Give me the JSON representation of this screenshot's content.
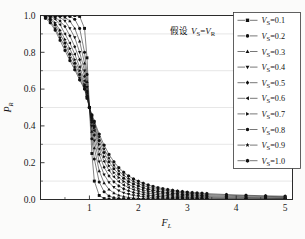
{
  "figure": {
    "background": "#fbfbfa",
    "plot_background": "#ffffff",
    "frame_color": "#2b2b2b",
    "grid_color": "#cfcfcf"
  },
  "annotation": {
    "cjk": "假设",
    "math_v_s": "V",
    "math_sub_s": "S",
    "equals": "=",
    "math_v_r": "V",
    "math_sub_r": "R",
    "full_text": "假设 VS = VR"
  },
  "axes": {
    "x_title_main": "F",
    "x_title_sub": "L",
    "y_title_main": "P",
    "y_title_sub": "R",
    "x_ticks": [
      "1",
      "2",
      "3",
      "4",
      "5"
    ],
    "x_tick_values": [
      1,
      2,
      3,
      4,
      5
    ],
    "y_ticks": [
      "0.0",
      "0.2",
      "0.4",
      "0.6",
      "0.8",
      "1.0"
    ],
    "y_tick_values": [
      0.0,
      0.2,
      0.4,
      0.6,
      0.8,
      1.0
    ],
    "xlim": [
      0,
      5.15
    ],
    "ylim": [
      0,
      1.0
    ],
    "x_minor_ticks": [
      0.5,
      1.5,
      2.5,
      3.5,
      4.5
    ],
    "y_minor_ticks": [
      0.1,
      0.3,
      0.5,
      0.7,
      0.9
    ],
    "grid": "horizontal-faint"
  },
  "legend": {
    "border_color": "#3a3a3a",
    "background": "#ffffff",
    "entries": [
      {
        "label_main": "V",
        "label_sub": "S",
        "label_val": "=0.1",
        "marker": "square",
        "text": "VS=0.1"
      },
      {
        "label_main": "V",
        "label_sub": "S",
        "label_val": "=0.2",
        "marker": "circle",
        "text": "VS=0.2"
      },
      {
        "label_main": "V",
        "label_sub": "S",
        "label_val": "=0.3",
        "marker": "triangle-up",
        "text": "VS=0.3"
      },
      {
        "label_main": "V",
        "label_sub": "S",
        "label_val": "=0.4",
        "marker": "triangle-down",
        "text": "VS=0.4"
      },
      {
        "label_main": "V",
        "label_sub": "S",
        "label_val": "=0.5",
        "marker": "diamond",
        "text": "VS=0.5"
      },
      {
        "label_main": "V",
        "label_sub": "S",
        "label_val": "=0.6",
        "marker": "triangle-left",
        "text": "VS=0.6"
      },
      {
        "label_main": "V",
        "label_sub": "S",
        "label_val": "=0.7",
        "marker": "triangle-right",
        "text": "VS=0.7"
      },
      {
        "label_main": "V",
        "label_sub": "S",
        "label_val": "=0.8",
        "marker": "circle",
        "text": "VS=0.8"
      },
      {
        "label_main": "V",
        "label_sub": "S",
        "label_val": "=0.9",
        "marker": "star",
        "text": "VS=0.9"
      },
      {
        "label_main": "V",
        "label_sub": "S",
        "label_val": "=1.0",
        "marker": "hexagon",
        "text": "VS=1.0"
      }
    ]
  },
  "chart_data": {
    "type": "line",
    "title": "",
    "xlabel": "F_L",
    "ylabel": "P_R",
    "xlim": [
      0,
      5.15
    ],
    "ylim": [
      0,
      1.0
    ],
    "grid": true,
    "legend_position": "upper-right",
    "annotation": "假设 VS = VR",
    "x_tick_labels": [
      "1",
      "2",
      "3",
      "4",
      "5"
    ],
    "y_tick_labels": [
      "0.0",
      "0.2",
      "0.4",
      "0.6",
      "0.8",
      "1.0"
    ],
    "note": "Family of sigmoid-like decreasing curves; all pass through approximately (1.0, 0.5). Smaller VS gives sharper transition. Markers placed at sampled x points.",
    "x": [
      0.1,
      0.2,
      0.3,
      0.4,
      0.5,
      0.6,
      0.7,
      0.8,
      0.9,
      0.95,
      1.0,
      1.05,
      1.1,
      1.2,
      1.3,
      1.4,
      1.5,
      1.6,
      1.7,
      1.8,
      1.9,
      2.0,
      2.1,
      2.2,
      2.3,
      2.4,
      2.5,
      2.6,
      2.7,
      2.8,
      2.9,
      3.0,
      3.1,
      3.2,
      3.3,
      3.4,
      3.8,
      4.2,
      4.6,
      5.0
    ],
    "series": [
      {
        "name": "VS=0.1",
        "marker": "square",
        "values": [
          1.0,
          1.0,
          1.0,
          1.0,
          1.0,
          1.0,
          1.0,
          0.995,
          0.93,
          0.77,
          0.5,
          0.25,
          0.1,
          0.022,
          0.005,
          0.001,
          0.0,
          0.0,
          0.0,
          0.0,
          0.0,
          0.0,
          0.0,
          0.0,
          0.0,
          0.0,
          0.0,
          0.0,
          0.0,
          0.0,
          0.0,
          0.0,
          0.0,
          0.0,
          0.0,
          0.0,
          0.0,
          0.0,
          0.0,
          0.0
        ]
      },
      {
        "name": "VS=0.2",
        "marker": "circle",
        "values": [
          1.0,
          1.0,
          1.0,
          1.0,
          0.999,
          0.995,
          0.98,
          0.93,
          0.8,
          0.68,
          0.5,
          0.33,
          0.22,
          0.095,
          0.042,
          0.019,
          0.009,
          0.005,
          0.003,
          0.002,
          0.001,
          0.001,
          0.0,
          0.0,
          0.0,
          0.0,
          0.0,
          0.0,
          0.0,
          0.0,
          0.0,
          0.0,
          0.0,
          0.0,
          0.0,
          0.0,
          0.0,
          0.0,
          0.0,
          0.0
        ]
      },
      {
        "name": "VS=0.3",
        "marker": "triangle-up",
        "values": [
          1.0,
          1.0,
          1.0,
          0.998,
          0.99,
          0.97,
          0.93,
          0.86,
          0.74,
          0.64,
          0.5,
          0.37,
          0.28,
          0.155,
          0.09,
          0.055,
          0.035,
          0.023,
          0.016,
          0.011,
          0.008,
          0.006,
          0.004,
          0.003,
          0.003,
          0.002,
          0.002,
          0.001,
          0.001,
          0.001,
          0.001,
          0.001,
          0.001,
          0.0,
          0.0,
          0.0,
          0.0,
          0.0,
          0.0,
          0.0
        ]
      },
      {
        "name": "VS=0.4",
        "marker": "triangle-down",
        "values": [
          1.0,
          1.0,
          0.998,
          0.99,
          0.97,
          0.93,
          0.88,
          0.8,
          0.7,
          0.61,
          0.5,
          0.4,
          0.32,
          0.205,
          0.135,
          0.093,
          0.066,
          0.048,
          0.036,
          0.028,
          0.022,
          0.018,
          0.014,
          0.012,
          0.01,
          0.008,
          0.007,
          0.006,
          0.005,
          0.005,
          0.004,
          0.004,
          0.003,
          0.003,
          0.003,
          0.002,
          0.002,
          0.001,
          0.001,
          0.001
        ]
      },
      {
        "name": "VS=0.5",
        "marker": "diamond",
        "values": [
          1.0,
          0.999,
          0.99,
          0.97,
          0.94,
          0.89,
          0.83,
          0.76,
          0.67,
          0.59,
          0.5,
          0.42,
          0.35,
          0.245,
          0.175,
          0.128,
          0.096,
          0.074,
          0.058,
          0.047,
          0.038,
          0.032,
          0.027,
          0.023,
          0.02,
          0.017,
          0.015,
          0.013,
          0.012,
          0.011,
          0.01,
          0.009,
          0.008,
          0.007,
          0.007,
          0.006,
          0.005,
          0.004,
          0.003,
          0.003
        ]
      },
      {
        "name": "VS=0.6",
        "marker": "triangle-left",
        "values": [
          1.0,
          0.995,
          0.98,
          0.95,
          0.9,
          0.85,
          0.79,
          0.72,
          0.645,
          0.58,
          0.5,
          0.43,
          0.375,
          0.275,
          0.207,
          0.158,
          0.123,
          0.098,
          0.079,
          0.065,
          0.054,
          0.046,
          0.039,
          0.034,
          0.03,
          0.026,
          0.023,
          0.021,
          0.019,
          0.017,
          0.016,
          0.014,
          0.013,
          0.012,
          0.011,
          0.011,
          0.009,
          0.007,
          0.006,
          0.005
        ]
      },
      {
        "name": "VS=0.7",
        "marker": "triangle-right",
        "values": [
          0.999,
          0.99,
          0.96,
          0.92,
          0.87,
          0.82,
          0.76,
          0.7,
          0.625,
          0.565,
          0.5,
          0.44,
          0.39,
          0.3,
          0.233,
          0.183,
          0.146,
          0.119,
          0.098,
          0.082,
          0.069,
          0.059,
          0.051,
          0.045,
          0.04,
          0.035,
          0.032,
          0.029,
          0.026,
          0.024,
          0.022,
          0.02,
          0.019,
          0.018,
          0.017,
          0.016,
          0.013,
          0.011,
          0.009,
          0.008
        ]
      },
      {
        "name": "VS=0.8",
        "marker": "circle",
        "values": [
          0.995,
          0.98,
          0.95,
          0.9,
          0.85,
          0.79,
          0.74,
          0.68,
          0.615,
          0.56,
          0.5,
          0.45,
          0.4,
          0.32,
          0.255,
          0.205,
          0.167,
          0.138,
          0.116,
          0.098,
          0.084,
          0.073,
          0.064,
          0.056,
          0.05,
          0.045,
          0.041,
          0.037,
          0.034,
          0.031,
          0.029,
          0.027,
          0.025,
          0.024,
          0.022,
          0.021,
          0.018,
          0.015,
          0.013,
          0.011
        ]
      },
      {
        "name": "VS=0.9",
        "marker": "star",
        "values": [
          0.99,
          0.97,
          0.93,
          0.88,
          0.83,
          0.77,
          0.72,
          0.66,
          0.605,
          0.555,
          0.5,
          0.455,
          0.415,
          0.34,
          0.275,
          0.225,
          0.186,
          0.155,
          0.132,
          0.113,
          0.098,
          0.086,
          0.076,
          0.067,
          0.06,
          0.055,
          0.05,
          0.046,
          0.042,
          0.039,
          0.036,
          0.034,
          0.032,
          0.03,
          0.028,
          0.027,
          0.023,
          0.02,
          0.017,
          0.015
        ]
      },
      {
        "name": "VS=1.0",
        "marker": "hexagon",
        "values": [
          0.985,
          0.96,
          0.92,
          0.865,
          0.81,
          0.755,
          0.705,
          0.65,
          0.6,
          0.55,
          0.5,
          0.46,
          0.425,
          0.355,
          0.295,
          0.245,
          0.205,
          0.173,
          0.148,
          0.128,
          0.112,
          0.099,
          0.088,
          0.079,
          0.071,
          0.064,
          0.059,
          0.054,
          0.05,
          0.046,
          0.043,
          0.04,
          0.038,
          0.036,
          0.034,
          0.032,
          0.027,
          0.023,
          0.02,
          0.018
        ]
      }
    ]
  }
}
